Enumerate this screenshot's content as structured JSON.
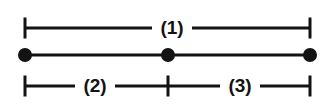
{
  "diagram": {
    "background_color": "#ffffff",
    "stroke_color": "#131313",
    "canvas": {
      "width": 334,
      "height": 111
    },
    "labels": {
      "total": "(1)",
      "left_part": "(2)",
      "right_part": "(3)"
    },
    "geometry": {
      "left_x": 25,
      "mid_x": 168,
      "right_x": 310,
      "top_dim_y": 28,
      "segment_y": 55,
      "bottom_dim_y": 86,
      "tick_half_height": 10.5,
      "point_radius": 7,
      "line_width": 3,
      "tick_width": 3
    },
    "label_positions": {
      "total_x": 172,
      "total_y": 28,
      "left_part_x": 95,
      "left_part_y": 86,
      "right_part_x": 240,
      "right_part_y": 86
    },
    "label_gaps": {
      "total_half_width": 20,
      "left_part_half_width": 20,
      "right_part_half_width": 20
    },
    "points": [
      {
        "name": "left-endpoint",
        "x": 25,
        "y": 55
      },
      {
        "name": "midpoint",
        "x": 168,
        "y": 55
      },
      {
        "name": "right-endpoint",
        "x": 310,
        "y": 55
      }
    ]
  }
}
